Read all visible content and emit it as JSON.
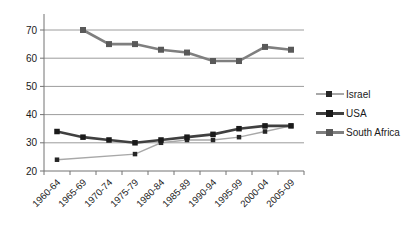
{
  "chart_data": {
    "type": "line",
    "title": "",
    "xlabel": "",
    "ylabel": "",
    "categories": [
      "1960-64",
      "1965-69",
      "1970-74",
      "1975-79",
      "1980-84",
      "1985-89",
      "1990-94",
      "1995-99",
      "2000-04",
      "2005-09"
    ],
    "series": [
      {
        "name": "Israel",
        "values": [
          24,
          null,
          null,
          26,
          30,
          31,
          31,
          32,
          34,
          36
        ],
        "line_color": "#a8a8a8",
        "marker_color": "#262626",
        "line_width": 1.4,
        "marker_size": 4.5
      },
      {
        "name": "USA",
        "values": [
          34,
          32,
          31,
          30,
          31,
          32,
          33,
          35,
          36,
          36
        ],
        "line_color": "#404040",
        "marker_color": "#1a1a1a",
        "line_width": 2.6,
        "marker_size": 5.5
      },
      {
        "name": "South Africa",
        "values": [
          null,
          70,
          65,
          65,
          63,
          62,
          59,
          59,
          64,
          63
        ],
        "line_color": "#7f7f7f",
        "marker_color": "#595959",
        "line_width": 2.6,
        "marker_size": 6
      }
    ],
    "ylim": [
      20,
      75
    ],
    "yticks": [
      20,
      30,
      40,
      50,
      60,
      70
    ],
    "grid": "horizontal",
    "legend_position": "right",
    "axis_color": "#737373",
    "grid_color": "#9c9c9c",
    "text_color": "#1a1a1a"
  }
}
